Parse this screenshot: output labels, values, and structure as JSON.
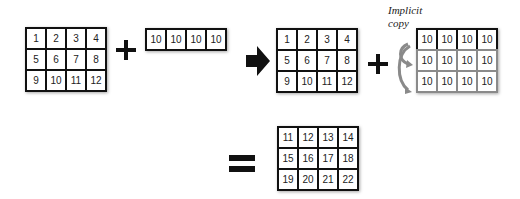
{
  "diagram": {
    "matrix_a": {
      "rows": [
        [
          "1",
          "2",
          "3",
          "4"
        ],
        [
          "5",
          "6",
          "7",
          "8"
        ],
        [
          "9",
          "10",
          "11",
          "12"
        ]
      ]
    },
    "row_vector": {
      "rows": [
        [
          "10",
          "10",
          "10",
          "10"
        ]
      ]
    },
    "matrix_a_copy": {
      "rows": [
        [
          "1",
          "2",
          "3",
          "4"
        ],
        [
          "5",
          "6",
          "7",
          "8"
        ],
        [
          "9",
          "10",
          "11",
          "12"
        ]
      ]
    },
    "broadcast_vector": {
      "original_row": [
        "10",
        "10",
        "10",
        "10"
      ],
      "copied_rows": [
        [
          "10",
          "10",
          "10",
          "10"
        ],
        [
          "10",
          "10",
          "10",
          "10"
        ]
      ]
    },
    "annotation": {
      "line1": "Implicit",
      "line2": "copy"
    },
    "result": {
      "rows": [
        [
          "11",
          "12",
          "13",
          "14"
        ],
        [
          "15",
          "16",
          "17",
          "18"
        ],
        [
          "19",
          "20",
          "21",
          "22"
        ]
      ]
    },
    "symbols": {
      "plus": "+",
      "arrow": "right-arrow",
      "equals": "="
    },
    "colors": {
      "stroke": "#111111",
      "copy_stroke": "#8a8a8a",
      "curved_arrow": "#8a8a8a"
    }
  }
}
